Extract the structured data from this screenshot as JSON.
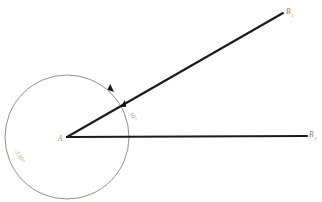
{
  "figure": {
    "canvas": {
      "width": 322,
      "height": 202,
      "background": "#ffffff"
    },
    "vertex": {
      "name": "A",
      "label": "A",
      "x": 67,
      "y": 137
    },
    "rays": [
      {
        "id": "ray-ab1",
        "label": "B",
        "subscript": "1",
        "from_x": 67,
        "from_y": 137,
        "to_x": 283,
        "to_y": 13,
        "label_x": 288,
        "label_y": 13,
        "color": "#1b1b1b"
      },
      {
        "id": "ray-ab2",
        "label": "B",
        "subscript": "2",
        "from_x": 67,
        "from_y": 137,
        "to_x": 307,
        "to_y": 136,
        "label_x": 311,
        "label_y": 136,
        "color": "#1b1b1b"
      }
    ],
    "circle": {
      "center_x": 67,
      "center_y": 137,
      "radius": 62,
      "color": "#6f6a63"
    },
    "arrow_markers": [
      {
        "id": "arc-arrow",
        "x": 113,
        "y": 91,
        "angle_deg": 55
      },
      {
        "id": "inner-arrow",
        "x": 124,
        "y": 100,
        "angle_deg": -75
      }
    ],
    "angle_labels": [
      {
        "id": "inner-angle",
        "text": "30°",
        "x": 131,
        "y": 112,
        "rotation": 62,
        "color": "#e0a97a"
      },
      {
        "id": "outer-angle",
        "text": "-330°",
        "x": 18,
        "y": 152,
        "rotation": 62,
        "color": "#ddab81"
      }
    ]
  }
}
